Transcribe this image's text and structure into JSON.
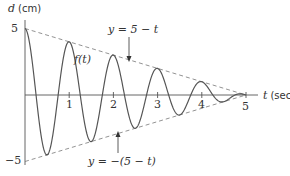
{
  "chart_data": {
    "type": "line",
    "title": "",
    "xlabel": "t (sec)",
    "ylabel": "d (cm)",
    "xlim": [
      0,
      5.2
    ],
    "ylim": [
      -5,
      5
    ],
    "x_ticks": [
      "1",
      "2",
      "3",
      "4",
      "5"
    ],
    "y_ticks": [
      "5",
      "−5"
    ],
    "grid": false,
    "series": [
      {
        "name": "f(t)",
        "formula": "(5 - t) * cos(2*pi*t)",
        "style": "solid",
        "peaks": [
          [
            0,
            5
          ],
          [
            1,
            4
          ],
          [
            2,
            3
          ],
          [
            3,
            2
          ],
          [
            4,
            1
          ],
          [
            5,
            0
          ]
        ],
        "troughs": [
          [
            0.5,
            -4.5
          ],
          [
            1.5,
            -3.5
          ],
          [
            2.5,
            -2.5
          ],
          [
            3.5,
            -1.5
          ],
          [
            4.5,
            -0.5
          ]
        ]
      },
      {
        "name": "y = 5 − t",
        "style": "dashed",
        "x": [
          0,
          5
        ],
        "values": [
          5,
          0
        ]
      },
      {
        "name": "y = −(5 − t)",
        "style": "dashed",
        "x": [
          0,
          5
        ],
        "values": [
          -5,
          0
        ]
      }
    ],
    "annotations": [
      {
        "text": "y = 5 − t",
        "arrow_to": "upper envelope"
      },
      {
        "text": "f(t)",
        "near": "second peak"
      },
      {
        "text": "y = −(5 − t)",
        "arrow_to": "lower envelope"
      }
    ]
  },
  "labels": {
    "ylabel_var": "d",
    "ylabel_unit": "(cm)",
    "xlabel_var": "t",
    "xlabel_unit": "(sec)",
    "y_top": "5",
    "y_bottom": "−5",
    "xt1": "1",
    "xt2": "2",
    "xt3": "3",
    "xt4": "4",
    "xt5": "5",
    "upper_env": "y = 5 − t",
    "lower_env": "y = −(5 − t)",
    "curve": "f(t)"
  }
}
